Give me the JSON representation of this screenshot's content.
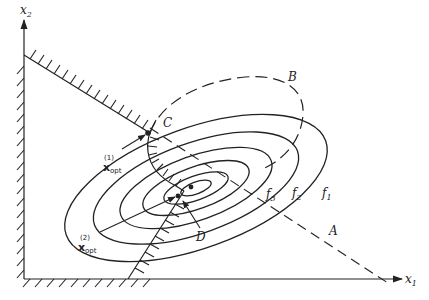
{
  "figure": {
    "type": "constrained optimization contour diagram",
    "colors": {
      "ink": "#222222",
      "background": "#ffffff"
    },
    "axes": {
      "x_label": "x",
      "x_label_sub": "1",
      "y_label": "x",
      "y_label_sub": "2"
    },
    "contours": [
      {
        "label": "f",
        "sub": "1"
      },
      {
        "label": "f",
        "sub": "2"
      },
      {
        "label": "f",
        "sub": "3"
      }
    ],
    "points": {
      "A": "A",
      "B": "B",
      "C": "C",
      "D": "D"
    },
    "optima": [
      {
        "symbol": "x",
        "sup": "(1)",
        "sub": "opt"
      },
      {
        "symbol": "x",
        "sup": "(2)",
        "sub": "opt"
      }
    ]
  }
}
